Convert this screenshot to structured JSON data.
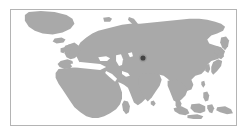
{
  "figure": {
    "kind": "locator-map",
    "canvas_width": 248,
    "canvas_height": 137,
    "background_color": "#ffffff"
  },
  "frame": {
    "x": 10,
    "y": 9,
    "width": 227,
    "height": 117,
    "border_color": "#b4b4b4",
    "border_width": 1,
    "fill_color": "#ffffff"
  },
  "map": {
    "projection": "equirectangular",
    "land_color": "#a9a9a9",
    "ocean_color": "#ffffff",
    "coastline_color": "#a9a9a9",
    "regions_shown": [
      "Greenland",
      "Europe",
      "Scandinavia",
      "British Isles",
      "Africa",
      "Arabian Peninsula",
      "Russia",
      "Siberia",
      "Central Asia",
      "India",
      "Sri Lanka",
      "China",
      "Korea",
      "Japan",
      "Southeast Asia",
      "Indonesia",
      "Philippines",
      "New Guinea"
    ],
    "water_bodies_shown": [
      "Atlantic Ocean",
      "Mediterranean Sea",
      "Black Sea",
      "Caspian Sea",
      "Red Sea",
      "Persian Gulf",
      "Arabian Sea",
      "Bay of Bengal",
      "Indian Ocean",
      "Arctic Ocean",
      "Sea of Japan",
      "South China Sea"
    ]
  },
  "marker": {
    "label": "location-marker",
    "x": 143,
    "y": 58,
    "radius": 2.6,
    "color": "#434343",
    "halo_radius": 4.2,
    "halo_color": "#8f8f8f",
    "approximate_region": "Central Asia"
  }
}
